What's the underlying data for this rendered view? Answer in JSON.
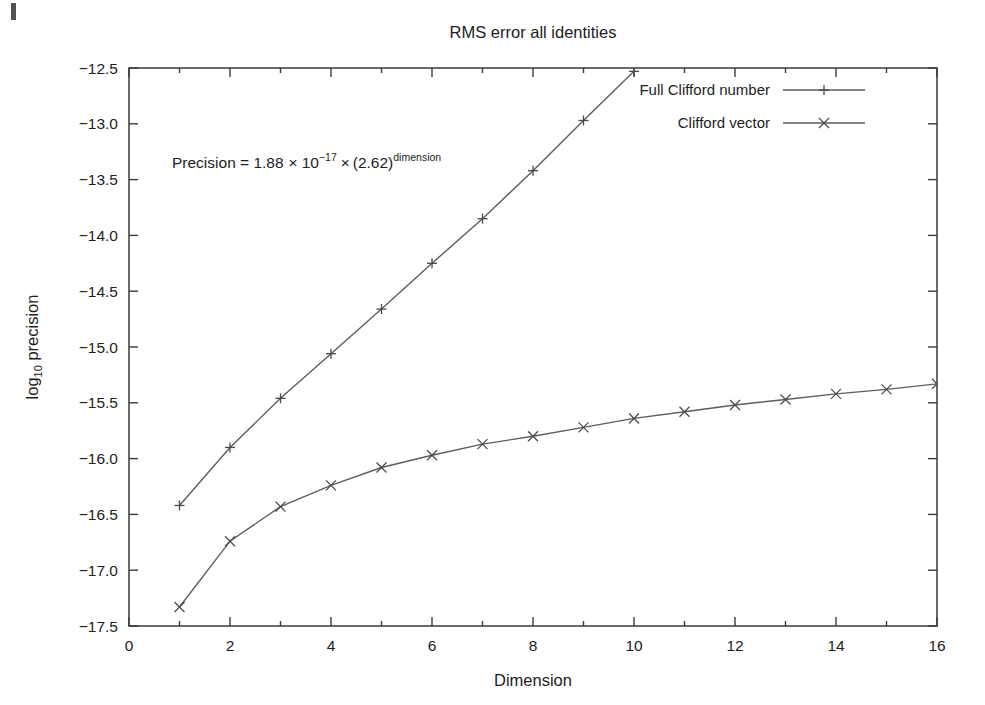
{
  "chart_data": {
    "type": "line",
    "title": "RMS error all identities",
    "xlabel": "Dimension",
    "ylabel": "log10 precision",
    "ylabel_base": "log",
    "ylabel_sub": "10",
    "ylabel_rest": " precision",
    "xlim": [
      0,
      16
    ],
    "ylim": [
      -17.5,
      -12.5
    ],
    "xticks": [
      0,
      2,
      4,
      6,
      8,
      10,
      12,
      14,
      16
    ],
    "xtick_labels": [
      "0",
      "2",
      "4",
      "6",
      "8",
      "10",
      "12",
      "14",
      "16"
    ],
    "xticks_minor": [
      1,
      3,
      5,
      7,
      9,
      11,
      13,
      15
    ],
    "yticks": [
      -12.5,
      -13.0,
      -13.5,
      -14.0,
      -14.5,
      -15.0,
      -15.5,
      -16.0,
      -16.5,
      -17.0,
      -17.5
    ],
    "ytick_labels": [
      "−12.5",
      "−13.0",
      "−13.5",
      "−14.0",
      "−14.5",
      "−15.0",
      "−15.5",
      "−16.0",
      "−16.5",
      "−17.0",
      "−17.5"
    ],
    "grid": false,
    "legend_position": "top-right",
    "series": [
      {
        "name": "Full Clifford number",
        "marker": "plus",
        "color": "#5d5d5d",
        "x": [
          1,
          2,
          3,
          4,
          5,
          6,
          7,
          8,
          9,
          10
        ],
        "values": [
          -16.42,
          -15.9,
          -15.46,
          -15.06,
          -14.66,
          -14.25,
          -13.85,
          -13.42,
          -12.97,
          -12.53
        ]
      },
      {
        "name": "Clifford vector",
        "marker": "cross",
        "color": "#6a6a6a",
        "x": [
          1,
          2,
          3,
          4,
          5,
          6,
          7,
          8,
          9,
          10,
          11,
          12,
          13,
          14,
          15,
          16
        ],
        "values": [
          -17.33,
          -16.74,
          -16.43,
          -16.24,
          -16.08,
          -15.97,
          -15.87,
          -15.8,
          -15.72,
          -15.64,
          -15.58,
          -15.52,
          -15.47,
          -15.42,
          -15.38,
          -15.33
        ]
      }
    ],
    "annotations": [
      {
        "id": "precision-formula",
        "parts": {
          "lead": "Precision = 1.88",
          "times1": "×",
          "base1": "10",
          "exp1": "−17",
          "times2": "×",
          "base2": "(2.62)",
          "exp2": "dimension"
        },
        "plain": "Precision = 1.88 × 10⁻¹⁷ × (2.62)^dimension",
        "x": 1.0,
        "y": -13.48
      }
    ]
  }
}
